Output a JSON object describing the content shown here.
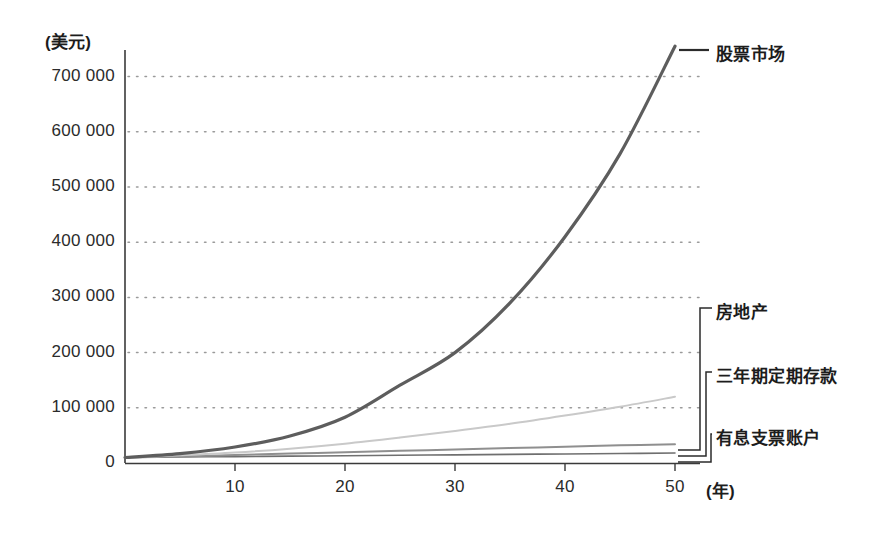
{
  "chart_data": {
    "type": "line",
    "title": "",
    "subtitle": "",
    "xlabel": "(年)",
    "ylabel": "(美元)",
    "xlim": [
      0,
      50
    ],
    "ylim": [
      0,
      780000
    ],
    "grid": true,
    "grid_style": "dotted-horizontal",
    "legend_position": "right-inline-labels",
    "x_ticks": [
      10,
      20,
      30,
      40,
      50
    ],
    "x_tick_labels": [
      "10",
      "20",
      "30",
      "40",
      "50"
    ],
    "y_ticks": [
      0,
      100000,
      200000,
      300000,
      400000,
      500000,
      600000,
      700000
    ],
    "y_tick_labels": [
      "0",
      "100 000",
      "200 000",
      "300 000",
      "400 000",
      "500 000",
      "600 000",
      "700 000"
    ],
    "x": [
      0,
      5,
      10,
      15,
      20,
      25,
      30,
      35,
      40,
      45,
      50
    ],
    "series": [
      {
        "name": "股票市场",
        "color": "#5d5d5d",
        "width": 3.2,
        "values": [
          10000,
          17000,
          29000,
          49000,
          83000,
          141000,
          200000,
          290000,
          410000,
          560000,
          755000
        ]
      },
      {
        "name": "房地产",
        "color": "#c9c9c9",
        "width": 2.0,
        "values": [
          10000,
          14000,
          19000,
          26000,
          35000,
          46000,
          58000,
          71000,
          86000,
          102000,
          120000
        ]
      },
      {
        "name": "三年期定期存款",
        "color": "#8f8f8f",
        "width": 2.0,
        "values": [
          10000,
          12000,
          14500,
          17000,
          19500,
          22000,
          24500,
          27000,
          29500,
          32000,
          34000
        ]
      },
      {
        "name": "有息支票账户",
        "color": "#6f6f6f",
        "width": 1.6,
        "values": [
          10000,
          10800,
          11600,
          12400,
          13200,
          14000,
          14800,
          15600,
          16400,
          17200,
          18000
        ]
      }
    ],
    "annotations": [
      {
        "label": "股票市场",
        "marker": "dash"
      },
      {
        "label": "房地产",
        "marker": "bracket"
      },
      {
        "label": "三年期定期存款",
        "marker": "bracket"
      },
      {
        "label": "有息支票账户",
        "marker": "bracket"
      }
    ],
    "colors": {
      "axis": "#3a3a3a",
      "grid": "#9a9a9a",
      "text": "#1c1c1c",
      "background": "#ffffff"
    }
  }
}
